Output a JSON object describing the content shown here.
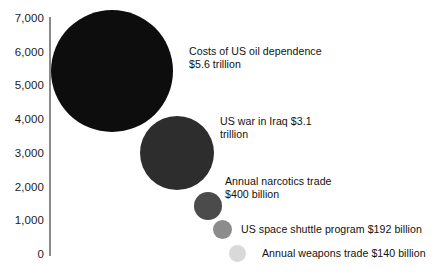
{
  "chart_data": {
    "type": "bubble",
    "title": "",
    "subtitle": "",
    "xlabel": "",
    "ylabel": "",
    "ylim": [
      0,
      7000
    ],
    "y_unit": "billion US dollars",
    "grid": false,
    "legend": "none (direct labels)",
    "axis": {
      "ticks": [
        {
          "label": "7,000",
          "value": 7000
        },
        {
          "label": "6,000",
          "value": 6000
        },
        {
          "label": "5,000",
          "value": 5000
        },
        {
          "label": "4,000",
          "value": 4000
        },
        {
          "label": "3,000",
          "value": 3000
        },
        {
          "label": "2,000",
          "value": 2000
        },
        {
          "label": "1,000",
          "value": 1000
        },
        {
          "label": "0",
          "value": 0
        }
      ]
    },
    "categories": [
      "Costs of US oil dependence",
      "US war in Iraq",
      "Annual narcotics trade",
      "US space shuttle program",
      "Annual weapons trade"
    ],
    "values": [
      5600,
      3100,
      400,
      192,
      140
    ],
    "value_labels": [
      "$5.6 trillion",
      "$3.1 trillion",
      "$400 billion",
      "$192 billion",
      "$140 billion"
    ],
    "bubbles": [
      {
        "name": "Costs of US oil dependence",
        "value": 5600,
        "value_label": "$5.6 trillion",
        "label": "Costs of US oil dependence\n$5.6 trillion",
        "color": "#0d0d0d",
        "cx": 112,
        "cy": 71,
        "r": 61,
        "label_x": 189,
        "label_y": 45
      },
      {
        "name": "US war in Iraq",
        "value": 3100,
        "value_label": "$3.1 trillion",
        "label": "US war in Iraq $3.1\ntrillion",
        "color": "#2d2d2d",
        "cx": 177,
        "cy": 153,
        "r": 37,
        "label_x": 220,
        "label_y": 115
      },
      {
        "name": "Annual narcotics trade",
        "value": 400,
        "value_label": "$400 billion",
        "label": "Annual narcotics trade\n$400 billion",
        "color": "#4b4b4b",
        "cx": 208,
        "cy": 206,
        "r": 14,
        "label_x": 225,
        "label_y": 175
      },
      {
        "name": "US space shuttle program",
        "value": 192,
        "value_label": "$192 billion",
        "label": "US space shuttle program $192 billion",
        "color": "#8c8c8c",
        "cx": 222,
        "cy": 229,
        "r": 9.5,
        "label_x": 241,
        "label_y": 223
      },
      {
        "name": "Annual weapons trade",
        "value": 140,
        "value_label": "$140 billion",
        "label": "Annual weapons trade $140 billion",
        "color": "#d9d9d9",
        "cx": 237,
        "cy": 253,
        "r": 8.5,
        "label_x": 262,
        "label_y": 247
      }
    ]
  },
  "colors": {
    "axis": "#8a8a8a",
    "text": "#111111",
    "background": "#ffffff"
  }
}
